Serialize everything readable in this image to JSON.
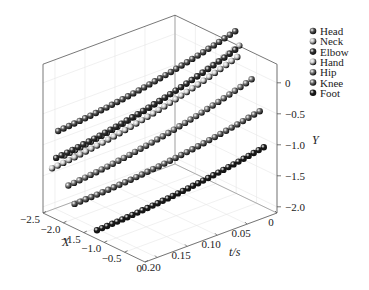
{
  "chart_data": {
    "type": "scatter3d",
    "title": "",
    "axes": {
      "x": {
        "label": "X",
        "ticks": [
          "-2.5",
          "-2.0",
          "-1.5",
          "-1.0",
          "-0.5",
          "0"
        ],
        "range": [
          -2.5,
          0
        ]
      },
      "t": {
        "label": "t/s",
        "ticks": [
          "0",
          "0.05",
          "0.10",
          "0.15",
          "0.20"
        ],
        "range": [
          0,
          0.22
        ]
      },
      "y": {
        "label": "Y",
        "ticks": [
          "0",
          "-0.5",
          "-1.0",
          "-1.5",
          "-2.0"
        ],
        "range": [
          -2.1,
          0.3
        ]
      }
    },
    "grid": true,
    "legend_position": "top-right",
    "series": [
      {
        "name": "Head",
        "color": "#555555",
        "x_start": -2.2,
        "x_end": -0.95,
        "y_start": -0.7,
        "y_end": 0.55
      },
      {
        "name": "Neck",
        "color": "#bbbbbb",
        "x_start": -2.05,
        "x_end": -0.85,
        "y_start": -1.05,
        "y_end": 0.35
      },
      {
        "name": "Elbow",
        "color": "#333333",
        "x_start": -2.25,
        "x_end": -0.95,
        "y_start": -1.15,
        "y_end": 0.25
      },
      {
        "name": "Hand",
        "color": "#cccccc",
        "x_start": -2.35,
        "x_end": -0.9,
        "y_start": -1.35,
        "y_end": 0.15
      },
      {
        "name": "Hip",
        "color": "#777777",
        "x_start": -1.95,
        "x_end": -0.55,
        "y_start": -1.5,
        "y_end": -0.1
      },
      {
        "name": "Knee",
        "color": "#666666",
        "x_start": -1.8,
        "x_end": -0.35,
        "y_start": -1.75,
        "y_end": -0.55
      },
      {
        "name": "Foot",
        "color": "#1a1a1a",
        "x_start": -1.25,
        "x_end": -0.25,
        "y_start": -2.0,
        "y_end": -1.1
      }
    ],
    "points_per_series": 34
  },
  "legend": {
    "items": [
      {
        "label": "Head",
        "color": "#555555"
      },
      {
        "label": "Neck",
        "color": "#bbbbbb"
      },
      {
        "label": "Elbow",
        "color": "#333333"
      },
      {
        "label": "Hand",
        "color": "#cccccc"
      },
      {
        "label": "Hip",
        "color": "#777777"
      },
      {
        "label": "Knee",
        "color": "#666666"
      },
      {
        "label": "Foot",
        "color": "#1a1a1a"
      }
    ]
  },
  "axis_labels": {
    "x": "X",
    "t": "t/s",
    "y": "Y"
  },
  "ticks": {
    "x": [
      "−2.5",
      "−2.0",
      "−1.5",
      "−1.0",
      "−0.5",
      "0"
    ],
    "t": [
      "0",
      "0.05",
      "0.10",
      "0.15",
      "0.20"
    ],
    "y": [
      "0",
      "−0.5",
      "−1.0",
      "−1.5",
      "−2.0"
    ]
  }
}
